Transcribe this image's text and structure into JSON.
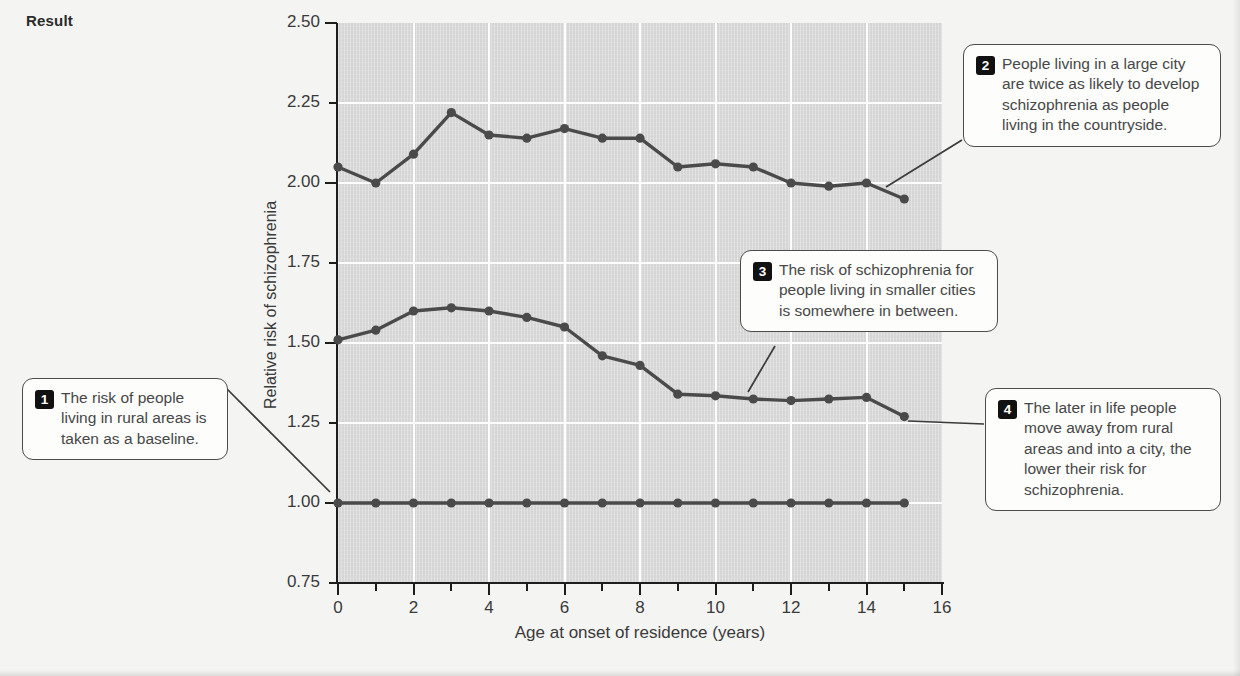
{
  "header": {
    "title": "Result"
  },
  "chart_data": {
    "type": "line",
    "title": "",
    "subtitle": "",
    "xlabel": "Age at onset of residence (years)",
    "ylabel": "Relative risk of schizophrenia",
    "xlim": [
      0,
      16
    ],
    "ylim": [
      0.75,
      2.5
    ],
    "x_ticks_major": [
      0,
      2,
      4,
      6,
      8,
      10,
      12,
      14,
      16
    ],
    "x_ticks_minor": [
      1,
      3,
      5,
      7,
      9,
      11,
      13,
      15
    ],
    "x_tick_labels": [
      "0",
      "2",
      "4",
      "6",
      "8",
      "10",
      "12",
      "14",
      "16"
    ],
    "y_ticks_major": [
      0.75,
      1.0,
      1.25,
      1.5,
      1.75,
      2.0,
      2.25,
      2.5
    ],
    "y_tick_labels": [
      "0.75",
      "1.00",
      "1.25",
      "1.50",
      "1.75",
      "2.00",
      "2.25",
      "2.50"
    ],
    "grid": true,
    "grid_color": "#fdfdfd",
    "plot_background": "#d5d5d5",
    "line_color": "#4a4a4a",
    "marker": "circle",
    "legend_position": "none",
    "x": [
      0,
      1,
      2,
      3,
      4,
      5,
      6,
      7,
      8,
      9,
      10,
      11,
      12,
      13,
      14,
      15
    ],
    "series": [
      {
        "name": "Large city",
        "color": "#4a4a4a",
        "values": [
          2.05,
          2.0,
          2.09,
          2.22,
          2.15,
          2.14,
          2.17,
          2.14,
          2.14,
          2.05,
          2.06,
          2.05,
          2.0,
          1.99,
          2.0,
          1.95
        ]
      },
      {
        "name": "Smaller cities",
        "color": "#4a4a4a",
        "values": [
          1.51,
          1.54,
          1.6,
          1.61,
          1.6,
          1.58,
          1.55,
          1.46,
          1.43,
          1.34,
          1.335,
          1.325,
          1.32,
          1.325,
          1.33,
          1.27
        ]
      },
      {
        "name": "Rural areas (baseline)",
        "color": "#4a4a4a",
        "values": [
          1.0,
          1.0,
          1.0,
          1.0,
          1.0,
          1.0,
          1.0,
          1.0,
          1.0,
          1.0,
          1.0,
          1.0,
          1.0,
          1.0,
          1.0,
          1.0
        ]
      }
    ],
    "annotations": [
      {
        "number": "1",
        "text": "The risk of people living in rural areas is taken as a baseline.",
        "target_series": "Rural areas (baseline)"
      },
      {
        "number": "2",
        "text": "People living in a large city are twice as likely to develop schizophrenia as people living in the countryside.",
        "target_series": "Large city"
      },
      {
        "number": "3",
        "text": "The risk of schizophrenia for people living in smaller cities is somewhere in between.",
        "target_series": "Smaller cities"
      },
      {
        "number": "4",
        "text": "The later in life people move away from rural areas and into a city, the lower their risk for schizophrenia.",
        "target_series": "Smaller cities"
      }
    ]
  }
}
